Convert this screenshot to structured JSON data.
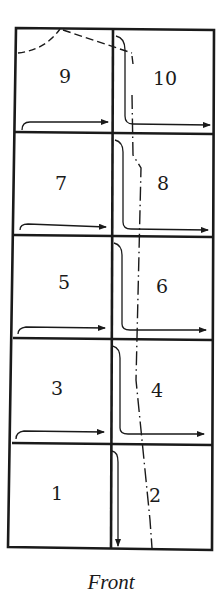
{
  "diagram": {
    "caption": "Front",
    "grid": {
      "left": 15,
      "middle": 113,
      "right": 214,
      "rows_y": [
        28,
        132,
        235,
        337,
        443,
        548
      ]
    },
    "cells": [
      {
        "label": "9",
        "x": 64,
        "y": 82
      },
      {
        "label": "10",
        "x": 163,
        "y": 84
      },
      {
        "label": "7",
        "x": 61,
        "y": 188
      },
      {
        "label": "8",
        "x": 163,
        "y": 184
      },
      {
        "label": "5",
        "x": 64,
        "y": 286
      },
      {
        "label": "6",
        "x": 162,
        "y": 290
      },
      {
        "label": "3",
        "x": 57,
        "y": 389
      },
      {
        "label": "4",
        "x": 157,
        "y": 392
      },
      {
        "label": "1",
        "x": 57,
        "y": 495
      },
      {
        "label": "2",
        "x": 155,
        "y": 495
      }
    ],
    "colors": {
      "ink": "#1a1a1a",
      "background": "#ffffff"
    }
  }
}
